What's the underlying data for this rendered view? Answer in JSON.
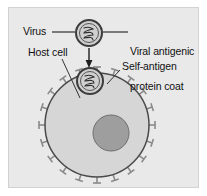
{
  "figure": {
    "width": 207,
    "height": 196,
    "background_color": "#ffffff",
    "panel_color": "#e9e9e9",
    "panel_border_color": "#d2d2d2",
    "ink_color": "#111111"
  },
  "labels": {
    "virus": "Virus",
    "host_cell": "Host cell",
    "viral_coat_line1": "Viral antigenic",
    "viral_coat_line2": "protein coat",
    "self_antigen": "Self-antigen"
  },
  "diagram": {
    "free_virus": {
      "name": "free virus particle",
      "center_x": 89,
      "center_y": 33,
      "outer_radius": 13,
      "inner_radius": 9.5,
      "outer_ring_color": "#3c3c3c",
      "inner_ring_color": "#555555",
      "capsid_fill": "#cfcfcf",
      "genome_color": "#2f2f2f",
      "genome_shape": "coiled helix"
    },
    "bound_virus": {
      "name": "virus bound to host cell membrane",
      "center_x": 90,
      "center_y": 81,
      "outer_radius": 13,
      "inner_radius": 9.5,
      "outer_ring_color": "#3c3c3c",
      "inner_ring_color": "#555555",
      "capsid_fill": "#cfcfcf",
      "genome_color": "#2f2f2f",
      "genome_shape": "coiled helix"
    },
    "arrow": {
      "name": "infection direction arrow",
      "from_x": 89,
      "from_y": 48,
      "to_x": 89,
      "to_y": 66,
      "color": "#1f1f1f"
    },
    "host_cell": {
      "name": "host cell body",
      "center_x": 97,
      "center_y": 125,
      "radius": 52,
      "fill": "#d6d6d6",
      "membrane_color": "#4a4a4a"
    },
    "nucleus": {
      "name": "cell nucleus",
      "center_x": 111,
      "center_y": 133,
      "radius": 18,
      "fill": "#9e9e9e",
      "border_color": "#6e6e6e"
    },
    "self_antigens": {
      "name": "self-antigen surface spikes",
      "count": 20,
      "shape": "T-shaped stem with crossbar",
      "color": "#8a8a8a",
      "stem_length": 6,
      "cap_width": 8
    },
    "leader_lines": [
      {
        "name": "virus-leader",
        "x1": 52,
        "y1": 32,
        "x2": 75,
        "y2": 32
      },
      {
        "name": "coat-leader",
        "x1": 103,
        "y1": 32,
        "x2": 127,
        "y2": 32
      },
      {
        "name": "host-cell-leader",
        "x1": 62,
        "y1": 59,
        "x2": 80,
        "y2": 98
      },
      {
        "name": "self-antigen-leader",
        "x1": 120,
        "y1": 70,
        "x2": 108,
        "y2": 83
      }
    ]
  }
}
